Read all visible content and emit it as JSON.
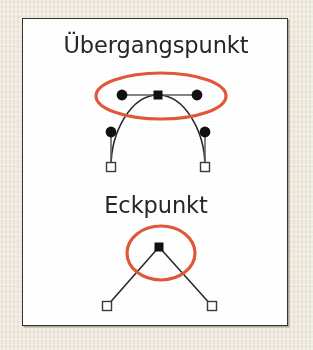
{
  "figure": {
    "kind": "bezier-node-types-illustration",
    "language": "de",
    "background_color": "#efeade",
    "panel_color": "#ffffff",
    "panel_border_color": "#3a342d",
    "highlight_color": "#e0583a",
    "stroke_color": "#2b2b2b",
    "node_fill_color": "#111111",
    "node_hollow_fill": "#ffffff"
  },
  "labels": {
    "transition_point": "Übergangspunkt",
    "corner_point": "Eckpunkt"
  },
  "diagrams": [
    {
      "id": "transition-point",
      "title": "Übergangspunkt",
      "description": "Bezier curve with a smooth anchor point whose two control handles are colinear",
      "anchor_points": [
        {
          "type": "filled-square",
          "role": "smooth-anchor",
          "x": 157,
          "y": 94
        },
        {
          "type": "hollow-square",
          "role": "end-anchor",
          "x": 110,
          "y": 166
        },
        {
          "type": "hollow-square",
          "role": "end-anchor",
          "x": 208,
          "y": 166
        }
      ],
      "control_handles": [
        {
          "type": "filled-circle",
          "role": "handle",
          "x": 121,
          "y": 94,
          "attached_to": "smooth-anchor"
        },
        {
          "type": "filled-circle",
          "role": "handle",
          "x": 196,
          "y": 94,
          "attached_to": "smooth-anchor"
        },
        {
          "type": "filled-circle",
          "role": "handle",
          "x": 110,
          "y": 131,
          "attached_to": "end-anchor-left"
        },
        {
          "type": "filled-circle",
          "role": "handle",
          "x": 208,
          "y": 131,
          "attached_to": "end-anchor-right"
        }
      ],
      "highlight_shape": {
        "type": "ellipse",
        "cx": 160,
        "cy": 95,
        "rx": 65,
        "ry": 23
      }
    },
    {
      "id": "corner-point",
      "title": "Eckpunkt",
      "description": "Two straight segments meeting at a sharp corner anchor point",
      "anchor_points": [
        {
          "type": "filled-square",
          "role": "corner-anchor",
          "x": 158,
          "y": 245
        },
        {
          "type": "hollow-square",
          "role": "end-anchor",
          "x": 106,
          "y": 305
        },
        {
          "type": "hollow-square",
          "role": "end-anchor",
          "x": 211,
          "y": 305
        }
      ],
      "control_handles": [],
      "highlight_shape": {
        "type": "ellipse",
        "cx": 160,
        "cy": 252,
        "rx": 34,
        "ry": 27
      }
    }
  ]
}
